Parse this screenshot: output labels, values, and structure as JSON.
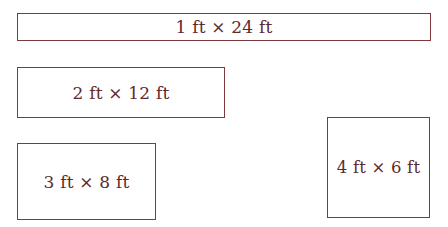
{
  "diagram": {
    "colors": {
      "border": "#7d3b3e",
      "text": "#5e2b2d",
      "background": "#ffffff"
    },
    "rectangles": [
      {
        "id": "r1",
        "width_ft": 1,
        "length_ft": 24,
        "label": "1 ft × 24 ft"
      },
      {
        "id": "r2",
        "width_ft": 2,
        "length_ft": 12,
        "label": "2 ft × 12 ft"
      },
      {
        "id": "r3",
        "width_ft": 3,
        "length_ft": 8,
        "label": "3 ft × 8 ft"
      },
      {
        "id": "r4",
        "width_ft": 4,
        "length_ft": 6,
        "label": "4 ft × 6 ft"
      }
    ]
  }
}
